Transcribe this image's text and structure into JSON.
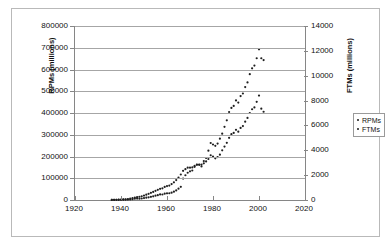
{
  "chart_data": {
    "type": "scatter",
    "title": "",
    "xlabel": "",
    "ylabel": "RPMs (millions)",
    "y2label": "FTMs (millions)",
    "xlim": [
      1920,
      2020
    ],
    "ylim": [
      0,
      800000
    ],
    "y2lim": [
      0,
      14000
    ],
    "xticks": [
      1920,
      1940,
      1960,
      1980,
      2000,
      2020
    ],
    "yticks": [
      0,
      100000,
      200000,
      300000,
      400000,
      500000,
      600000,
      700000,
      800000
    ],
    "y2ticks": [
      0,
      2000,
      4000,
      6000,
      8000,
      10000,
      12000,
      14000
    ],
    "grid": true,
    "legend_position": "right-outside",
    "legend": [
      "RPMs",
      "FTMs"
    ],
    "marker_color": "#1f1f1f",
    "gridline_color": "#a6a6a6",
    "axis_color": "#868686",
    "series": [
      {
        "name": "RPMs",
        "axis": "left",
        "x": [
          1936,
          1937,
          1938,
          1939,
          1940,
          1941,
          1942,
          1943,
          1944,
          1945,
          1946,
          1947,
          1948,
          1949,
          1950,
          1951,
          1952,
          1953,
          1954,
          1955,
          1956,
          1957,
          1958,
          1959,
          1960,
          1961,
          1962,
          1963,
          1964,
          1965,
          1966,
          1967,
          1968,
          1969,
          1970,
          1971,
          1972,
          1973,
          1974,
          1975,
          1976,
          1977,
          1978,
          1979,
          1980,
          1981,
          1982,
          1983,
          1984,
          1985,
          1986,
          1987,
          1988,
          1989,
          1990,
          1991,
          1992,
          1993,
          1994,
          1995,
          1996,
          1997,
          1998,
          1999,
          2000,
          2001,
          2002
        ],
        "values": [
          400,
          600,
          700,
          900,
          1200,
          1500,
          1700,
          2000,
          2400,
          3400,
          6000,
          6700,
          6200,
          7000,
          8700,
          10600,
          12500,
          14800,
          16800,
          19800,
          22400,
          25500,
          25400,
          29300,
          30600,
          31100,
          33600,
          38500,
          44100,
          51900,
          60600,
          98700,
          113900,
          125400,
          131700,
          135700,
          152400,
          162000,
          162900,
          162800,
          179000,
          193200,
          226800,
          262000,
          255200,
          248900,
          259600,
          281800,
          305100,
          336400,
          366500,
          404500,
          423300,
          432700,
          457900,
          448000,
          478000,
          489700,
          519400,
          540700,
          578700,
          605600,
          618100,
          651700,
          692800,
          651700,
          643400
        ]
      },
      {
        "name": "FTMs",
        "axis": "right",
        "x": [
          1936,
          1937,
          1938,
          1939,
          1940,
          1941,
          1942,
          1943,
          1944,
          1945,
          1946,
          1947,
          1948,
          1949,
          1950,
          1951,
          1952,
          1953,
          1954,
          1955,
          1956,
          1957,
          1958,
          1959,
          1960,
          1961,
          1962,
          1963,
          1964,
          1965,
          1966,
          1967,
          1968,
          1969,
          1970,
          1971,
          1972,
          1973,
          1974,
          1975,
          1976,
          1977,
          1978,
          1979,
          1980,
          1981,
          1982,
          1983,
          1984,
          1985,
          1986,
          1987,
          1988,
          1989,
          1990,
          1991,
          1992,
          1993,
          1994,
          1995,
          1996,
          1997,
          1998,
          1999,
          2000,
          2001,
          2002
        ],
        "values": [
          10,
          14,
          18,
          24,
          32,
          45,
          60,
          80,
          110,
          150,
          190,
          230,
          260,
          300,
          360,
          430,
          500,
          580,
          650,
          740,
          820,
          900,
          940,
          1050,
          1120,
          1160,
          1280,
          1420,
          1600,
          1810,
          2050,
          2350,
          2480,
          2600,
          2600,
          2620,
          2750,
          2850,
          2830,
          2700,
          2950,
          3100,
          3300,
          3600,
          3500,
          3350,
          3450,
          3650,
          4000,
          4300,
          4600,
          5000,
          5300,
          5400,
          5650,
          5500,
          5800,
          5950,
          6300,
          6600,
          7000,
          7300,
          7450,
          7900,
          8400,
          7350,
          7100
        ]
      }
    ]
  },
  "legend": {
    "items": [
      {
        "label": "RPMs"
      },
      {
        "label": "FTMs"
      }
    ]
  },
  "axes": {
    "left_title": "RPMs (millions)",
    "right_title": "FTMs (millions)"
  }
}
